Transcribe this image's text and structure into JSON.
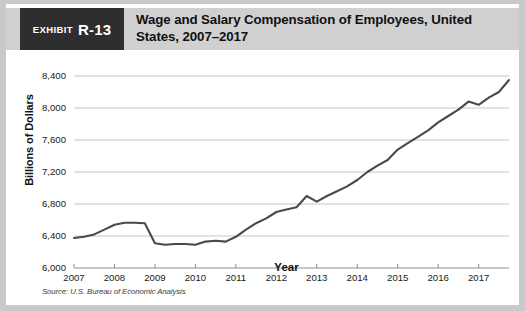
{
  "exhibit": {
    "tag_word": "Exhibit",
    "tag_number": "R-13",
    "title": "Wage and Salary Compensation of Employees, United States, 2007–2017"
  },
  "source_note": "Source: U.S. Bureau of Economic Analysis",
  "chart_data": {
    "type": "line",
    "title": "Wage and Salary Compensation of Employees, United States, 2007–2017",
    "xlabel": "Year",
    "ylabel": "Billions of Dollars",
    "xlim": [
      2007,
      2017.75
    ],
    "ylim": [
      6000,
      8400
    ],
    "yticks": [
      6000,
      6400,
      6800,
      7200,
      7600,
      8000,
      8400
    ],
    "ytick_labels": [
      "6,000",
      "6,400",
      "6,800",
      "7,200",
      "7,600",
      "8,000",
      "8,400"
    ],
    "xticks": [
      2007,
      2008,
      2009,
      2010,
      2011,
      2012,
      2013,
      2014,
      2015,
      2016,
      2017
    ],
    "xtick_labels": [
      "2007",
      "2008",
      "2009",
      "2010",
      "2011",
      "2012",
      "2013",
      "2014",
      "2015",
      "2016",
      "2017"
    ],
    "grid": "horizontal",
    "legend": "none",
    "line_color": "#4a4a4a",
    "series": [
      {
        "name": "Wage and salary compensation",
        "x": [
          2007.0,
          2007.25,
          2007.5,
          2007.75,
          2008.0,
          2008.25,
          2008.5,
          2008.75,
          2009.0,
          2009.25,
          2009.5,
          2009.75,
          2010.0,
          2010.25,
          2010.5,
          2010.75,
          2011.0,
          2011.25,
          2011.5,
          2011.75,
          2012.0,
          2012.25,
          2012.5,
          2012.75,
          2013.0,
          2013.25,
          2013.5,
          2013.75,
          2014.0,
          2014.25,
          2014.5,
          2014.75,
          2015.0,
          2015.25,
          2015.5,
          2015.75,
          2016.0,
          2016.25,
          2016.5,
          2016.75,
          2017.0,
          2017.25,
          2017.5,
          2017.75
        ],
        "values": [
          6375,
          6390,
          6420,
          6480,
          6540,
          6565,
          6565,
          6560,
          6310,
          6290,
          6300,
          6300,
          6290,
          6330,
          6340,
          6330,
          6390,
          6480,
          6560,
          6620,
          6700,
          6730,
          6760,
          6900,
          6830,
          6900,
          6960,
          7020,
          7100,
          7200,
          7280,
          7350,
          7480,
          7560,
          7640,
          7720,
          7820,
          7900,
          7980,
          8080,
          8040,
          8130,
          8200,
          8350
        ]
      }
    ]
  }
}
